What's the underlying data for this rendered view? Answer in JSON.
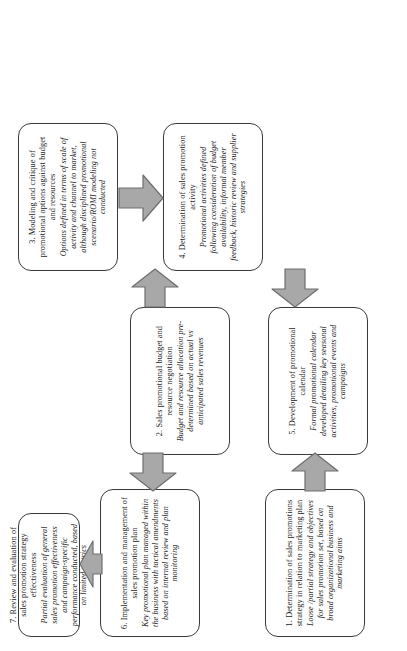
{
  "diagram": {
    "type": "process-flowchart",
    "orientation": "rotated-90-counterclockwise",
    "node_count": 7,
    "colors": {
      "node_border": "#3a3a3a",
      "node_fill": "#ffffff",
      "arrow_fill": "#a8a8a8",
      "arrow_border": "#6e6e6e",
      "text": "#1a1a1a"
    },
    "nodes": [
      {
        "id": "1",
        "title": "1. Determination of sales promotions strategy in relation to marketing  plan",
        "detail": "Loose /partial strategy and objectives for sales promotion set, based on broad organizational business and marketing aims"
      },
      {
        "id": "2",
        "title": "2. Sales promotional budget and resource negotiation",
        "detail": "Budget and resource allocation pre-determined based on actual vs anticipated sales revenues"
      },
      {
        "id": "3",
        "title": "3. Modeling and critique of promotional options against budget and resources",
        "detail": "Options defined in terms of scale of activity and channel to market, although disciplined promotional scenario/ROMI modeling not conducted"
      },
      {
        "id": "4",
        "title": "4. Determination of sales promotion activity",
        "detail": "Promotional activities defined following consideration of budget availability, informal member feedback, historic review and supplier strategies"
      },
      {
        "id": "5",
        "title": "5. Development of promotional calendar",
        "detail": "Formal promotional calendar developed  detailing key seasonal activities, promotional events and campaigns"
      },
      {
        "id": "6",
        "title": "6. Implementation and management of sales promotion plan",
        "detail": "Key promotional plan managed within the business with tactical amendments based on internal review and plan monitoring"
      },
      {
        "id": "7",
        "title": "7. Review and evaluation of sales promotion strategy effectiveness",
        "detail": "Partial evaluation of general sales promotion effectiveness and campaign-specific performance conducted, based on limited metrics"
      }
    ],
    "arrows": [
      {
        "id": "a1",
        "from": "1",
        "to": "2",
        "label": "block-arrow-right"
      },
      {
        "id": "a2",
        "from": "2",
        "to": "3",
        "label": "block-arrow-right"
      },
      {
        "id": "a3",
        "from": "3",
        "to": "4",
        "label": "block-arrow-down"
      },
      {
        "id": "a4",
        "from": "4",
        "to": "5",
        "label": "block-arrow-left"
      },
      {
        "id": "a5",
        "from": "5",
        "to": "6",
        "label": "block-arrow-left"
      },
      {
        "id": "a6",
        "from": "6",
        "to": "7",
        "label": "block-arrow-up"
      }
    ]
  }
}
